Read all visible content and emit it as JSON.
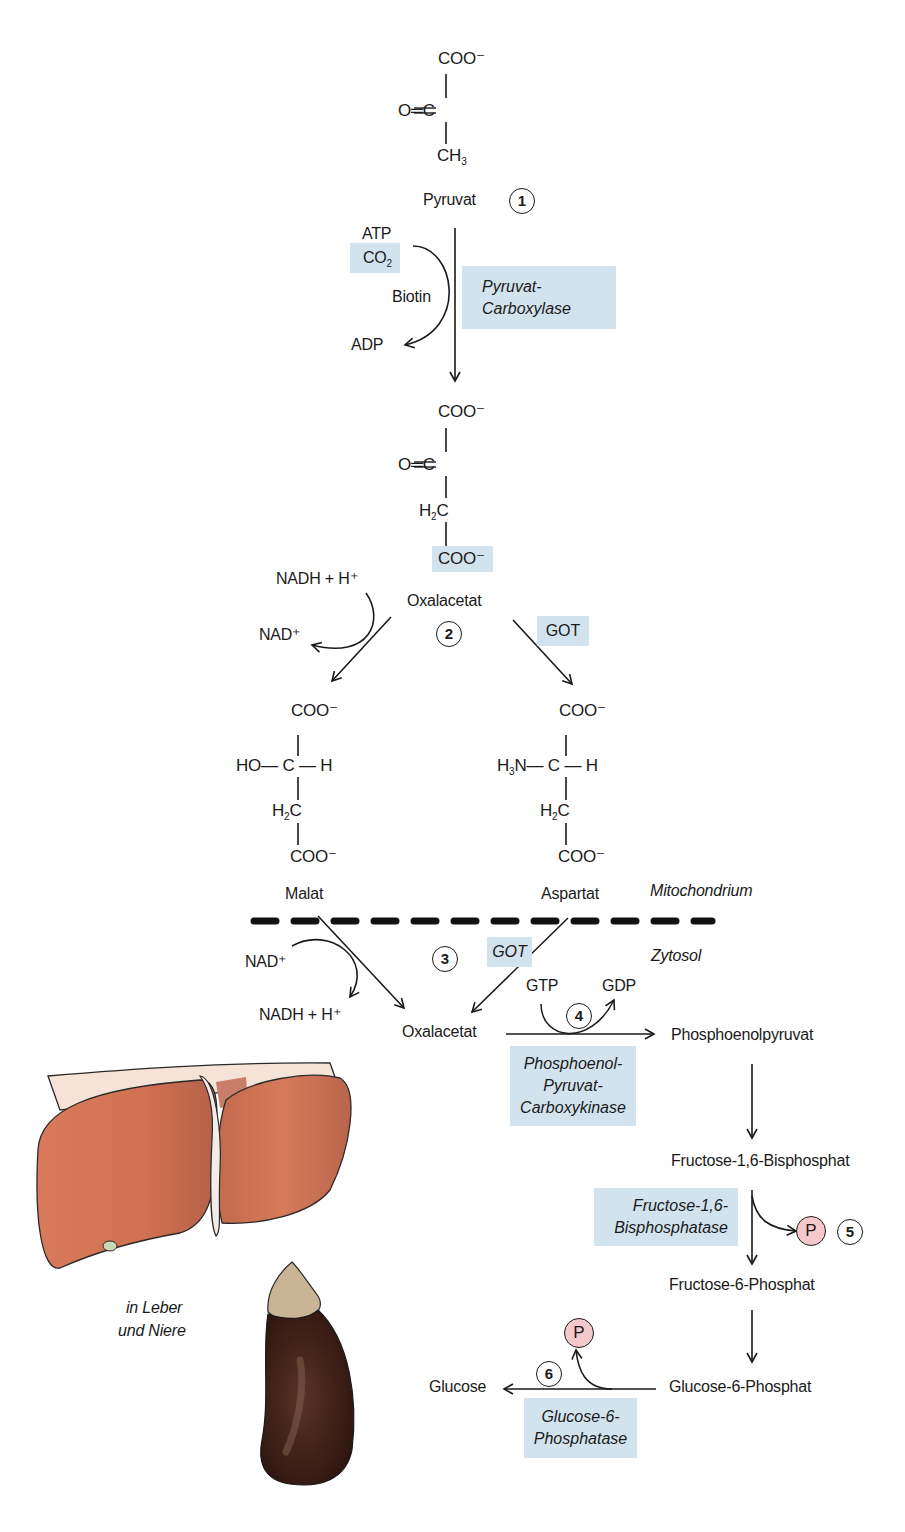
{
  "pyruvate": {
    "coo": "COO⁻",
    "carbonyl": "O═C",
    "ch3_base": "CH",
    "ch3_sub": "3",
    "label": "Pyruvat",
    "step": "1"
  },
  "step1": {
    "atp": "ATP",
    "co2_base": "CO",
    "co2_sub": "2",
    "biotin": "Biotin",
    "adp": "ADP",
    "enzyme_line1": "Pyruvat-",
    "enzyme_line2": "Carboxylase"
  },
  "oxaloacetate_mito": {
    "coo_top": "COO⁻",
    "carbonyl": "O═C",
    "h2c_base": "H",
    "h2c_sub": "2",
    "h2c_c": "C",
    "coo_bottom": "COO⁻",
    "label": "Oxalacetat"
  },
  "step2": {
    "nadh": "NADH + H⁺",
    "nad": "NAD⁺",
    "step": "2",
    "enzyme": "GOT"
  },
  "malate": {
    "coo_top": "COO⁻",
    "center": "HO— C — H",
    "h2c_base": "H",
    "h2c_sub": "2",
    "h2c_c": "C",
    "coo_bottom": "COO⁻",
    "label": "Malat"
  },
  "aspartate": {
    "coo_top": "COO⁻",
    "amine_base": "H",
    "amine_sub": "3",
    "amine_rest": "N— C — H",
    "h2c_base": "H",
    "h2c_sub": "2",
    "h2c_c": "C",
    "coo_bottom": "COO⁻",
    "label": "Aspartat"
  },
  "compartments": {
    "mito": "Mitochondrium",
    "cyto": "Zytosol"
  },
  "step3": {
    "nad": "NAD⁺",
    "nadh": "NADH + H⁺",
    "step": "3",
    "enzyme": "GOT"
  },
  "oxaloacetate_cyto": {
    "label": "Oxalacetat"
  },
  "step4": {
    "gtp": "GTP",
    "gdp": "GDP",
    "step": "4",
    "enzyme_line1": "Phosphoenol-",
    "enzyme_line2": "Pyruvat-",
    "enzyme_line3": "Carboxykinase",
    "product": "Phosphoenolpyruvat"
  },
  "step5": {
    "substrate": "Fructose-1,6-Bisphosphat",
    "enzyme_line1": "Fructose-1,6-",
    "enzyme_line2": "Bisphosphatase",
    "phosphate": "P",
    "step": "5",
    "product": "Fructose-6-Phosphat"
  },
  "step6": {
    "substrate": "Glucose-6-Phosphat",
    "product": "Glucose",
    "phosphate": "P",
    "step": "6",
    "enzyme_line1": "Glucose-6-",
    "enzyme_line2": "Phosphatase"
  },
  "organs": {
    "caption_line1": "in Leber",
    "caption_line2": "und Niere"
  },
  "colors": {
    "enzyme_bg": "#d3e3ee",
    "phosphate_bg": "#f5c9cc",
    "liver": "#d9775a",
    "kidney": "#3b1e16"
  }
}
